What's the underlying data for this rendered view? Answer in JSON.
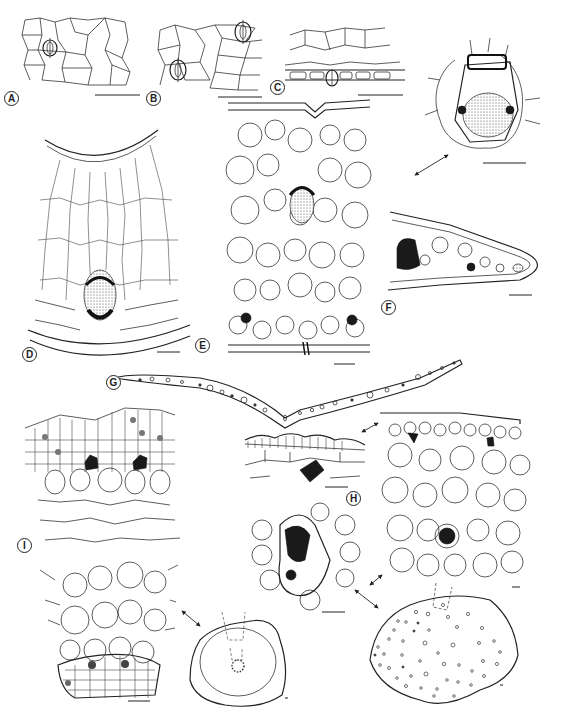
{
  "figure": {
    "type": "botanical anatomy plate (leaf cross-sections, line drawings)",
    "panels": [
      {
        "id": "A",
        "label": "A",
        "content": "epidermis surface view with one stoma"
      },
      {
        "id": "B",
        "label": "B",
        "content": "epidermis surface view with two stomata"
      },
      {
        "id": "C",
        "label": "C",
        "content": "epidermis in section with stoma"
      },
      {
        "id": "D",
        "label": "D",
        "content": "leaf transverse section, midrib with vascular bundle"
      },
      {
        "id": "E",
        "label": "E",
        "content": "leaf transverse section with central vascular bundle and two small bundles"
      },
      {
        "id": "F",
        "label": "F",
        "content": "leaf margin section, with enlarged vascular bundle detail"
      },
      {
        "id": "G",
        "label": "G",
        "content": "V-shaped leaf outline with vascular bundle positions"
      },
      {
        "id": "H",
        "label": "H",
        "content": "epidermis with crystal, mesophyll with bundle, and elliptic leaf outline"
      },
      {
        "id": "I",
        "label": "I",
        "content": "section with sclerenchyma crystals, vascular arc, and round leaf outline"
      }
    ],
    "scale_bars_visible": 14,
    "arrows_visible": 5
  }
}
